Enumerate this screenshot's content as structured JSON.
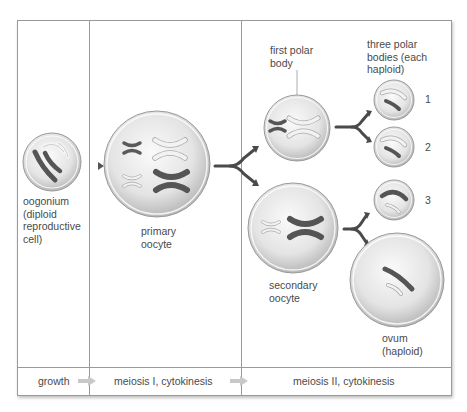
{
  "diagram": {
    "cells": {
      "oogonium": {
        "label": "oogonium\n(diploid\nreproductive\ncell)"
      },
      "primary_oocyte": {
        "label": "primary\noocyte"
      },
      "first_polar_body": {
        "label": "first polar\nbody"
      },
      "secondary_oocyte": {
        "label": "secondary\noocyte"
      },
      "polar_bodies_header": {
        "label": "three polar\nbodies (each\nhaploid)"
      },
      "polar_body_numbers": [
        "1",
        "2",
        "3"
      ],
      "ovum": {
        "label": "ovum\n(haploid)"
      }
    },
    "stages": [
      {
        "label": "growth"
      },
      {
        "label": "meiosis I, cytokinesis"
      },
      {
        "label": "meiosis II, cytokinesis"
      }
    ],
    "colors": {
      "frame_line": "#9a9a9a",
      "text": "#4a4a4a",
      "cell_fill": "#e6e6e6",
      "dark_chromosome": "#5a5a5a",
      "light_chromosome": "#f2f2f2",
      "arrow_dark": "#555555",
      "arrow_light": "#c8c8c8"
    }
  }
}
